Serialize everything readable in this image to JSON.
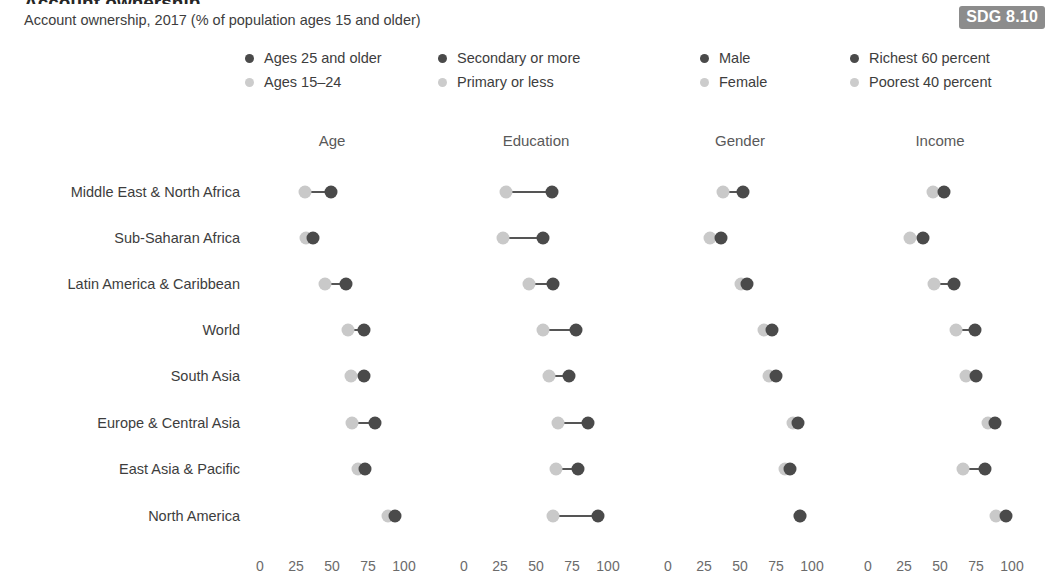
{
  "header": {
    "title": "Account ownership",
    "subtitle": "Account ownership, 2017 (% of population ages 15 and older)",
    "badge": "SDG 8.10"
  },
  "legend": {
    "groups": [
      {
        "x": 245,
        "dark_label": "Ages 25 and older",
        "light_label": "Ages 15–24"
      },
      {
        "x": 438,
        "dark_label": "Secondary or more",
        "light_label": "Primary or less"
      },
      {
        "x": 700,
        "dark_label": "Male",
        "light_label": "Female"
      },
      {
        "x": 850,
        "dark_label": "Richest 60 percent",
        "light_label": "Poorest 40 percent"
      }
    ]
  },
  "colors": {
    "dark": "#4a4a4a",
    "light": "#c9c9c9",
    "connector": "#555555",
    "badge_bg": "#8c8c8c",
    "text": "#3d3d3d"
  },
  "axis": {
    "ticks": [
      0,
      25,
      50,
      75,
      100
    ],
    "tick_labels": [
      "0",
      "25",
      "50",
      "75",
      "100"
    ],
    "min": 0,
    "max": 100
  },
  "panels": [
    {
      "name": "Age",
      "header": "Age",
      "x0": 260,
      "x100": 404
    },
    {
      "name": "Education",
      "header": "Education",
      "x0": 464,
      "x100": 608
    },
    {
      "name": "Gender",
      "header": "Gender",
      "x0": 668,
      "x100": 812
    },
    {
      "name": "Income",
      "header": "Income",
      "x0": 868,
      "x100": 1012
    }
  ],
  "rows": [
    {
      "label": "Middle East & North Africa",
      "y": 192
    },
    {
      "label": "Sub-Saharan Africa",
      "y": 238
    },
    {
      "label": "Latin America & Caribbean",
      "y": 284
    },
    {
      "label": "World",
      "y": 330
    },
    {
      "label": "South Asia",
      "y": 376
    },
    {
      "label": "Europe & Central Asia",
      "y": 423
    },
    {
      "label": "East Asia & Pacific",
      "y": 469
    },
    {
      "label": "North America",
      "y": 516
    }
  ],
  "chart_data": {
    "type": "scatter",
    "subtype": "dumbbell",
    "title": "Account ownership, 2017 (% of population ages 15 and older)",
    "xlabel": "",
    "ylabel": "",
    "xlim": [
      0,
      100
    ],
    "xticks": [
      0,
      25,
      50,
      75,
      100
    ],
    "grid": false,
    "legend_position": "top",
    "categories": [
      "Middle East & North Africa",
      "Sub-Saharan Africa",
      "Latin America & Caribbean",
      "World",
      "South Asia",
      "Europe & Central Asia",
      "East Asia & Pacific",
      "North America"
    ],
    "panels": [
      {
        "name": "Age",
        "series": [
          {
            "name": "Ages 25 and older",
            "shade": "dark",
            "values": [
              49,
              37,
              60,
              72,
              72,
              80,
              73,
              94
            ]
          },
          {
            "name": "Ages 15–24",
            "shade": "light",
            "values": [
              31,
              32,
              45,
              61,
              63,
              64,
              68,
              89
            ]
          }
        ]
      },
      {
        "name": "Education",
        "series": [
          {
            "name": "Secondary or more",
            "shade": "dark",
            "values": [
              61,
              55,
              62,
              78,
              73,
              86,
              79,
              93
            ]
          },
          {
            "name": "Primary or less",
            "shade": "light",
            "values": [
              29,
              27,
              45,
              55,
              59,
              65,
              64,
              62
            ]
          }
        ]
      },
      {
        "name": "Gender",
        "series": [
          {
            "name": "Male",
            "shade": "dark",
            "values": [
              52,
              37,
              55,
              72,
              75,
              90,
              85,
              92
            ]
          },
          {
            "name": "Female",
            "shade": "light",
            "values": [
              38,
              29,
              51,
              67,
              70,
              87,
              81,
              92
            ]
          }
        ]
      },
      {
        "name": "Income",
        "series": [
          {
            "name": "Richest 60 percent",
            "shade": "dark",
            "values": [
              53,
              38,
              60,
              74,
              75,
              88,
              81,
              96
            ]
          },
          {
            "name": "Poorest 40 percent",
            "shade": "light",
            "values": [
              45,
              29,
              46,
              61,
              68,
              83,
              66,
              89
            ]
          }
        ]
      }
    ]
  }
}
